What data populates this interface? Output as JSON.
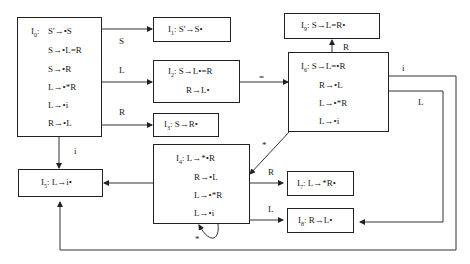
{
  "states": {
    "I0": {
      "name": "I",
      "sub": "0",
      "items": [
        "S'→•S",
        "S→•L=R",
        "S→•R",
        "L→•*R",
        "L→•i",
        "R→•L"
      ]
    },
    "I1": {
      "name": "I",
      "sub": "1",
      "items": [
        "S'→S•"
      ]
    },
    "I2": {
      "name": "I",
      "sub": "2",
      "items": [
        "S→L•=R",
        "R→L•"
      ]
    },
    "I3": {
      "name": "I",
      "sub": "3",
      "items": [
        "S→R•"
      ]
    },
    "I4": {
      "name": "I",
      "sub": "4",
      "items": [
        "L→*•R",
        "R→•L",
        "L→•*R",
        "L→•i"
      ]
    },
    "I5": {
      "name": "I",
      "sub": "5",
      "items": [
        "L→i•"
      ]
    },
    "I6": {
      "name": "I",
      "sub": "6",
      "items": [
        "S→L=•R",
        "R→•L",
        "L→•*R",
        "L→•i"
      ]
    },
    "I7": {
      "name": "I",
      "sub": "7",
      "items": [
        "L→*R•"
      ]
    },
    "I8": {
      "name": "I",
      "sub": "8",
      "items": [
        "R→L•"
      ]
    },
    "I9": {
      "name": "I",
      "sub": "9",
      "items": [
        "S→L=R•"
      ]
    }
  },
  "edges": [
    {
      "from": "I0",
      "to": "I1",
      "label": "S"
    },
    {
      "from": "I0",
      "to": "I2",
      "label": "L"
    },
    {
      "from": "I0",
      "to": "I3",
      "label": "R"
    },
    {
      "from": "I0",
      "to": "I5",
      "label": "i"
    },
    {
      "from": "I2",
      "to": "I6",
      "label": "="
    },
    {
      "from": "I6",
      "to": "I9",
      "label": "R"
    },
    {
      "from": "I6",
      "to": "I4",
      "label": "*"
    },
    {
      "from": "I6",
      "to": "I5",
      "label": "i"
    },
    {
      "from": "I6",
      "to": "I8",
      "label": "L"
    },
    {
      "from": "I4",
      "to": "I5",
      "label": ""
    },
    {
      "from": "I4",
      "to": "I7",
      "label": "R"
    },
    {
      "from": "I4",
      "to": "I8",
      "label": "L"
    },
    {
      "from": "I4",
      "to": "I4",
      "label": "*"
    }
  ],
  "sep": ":"
}
